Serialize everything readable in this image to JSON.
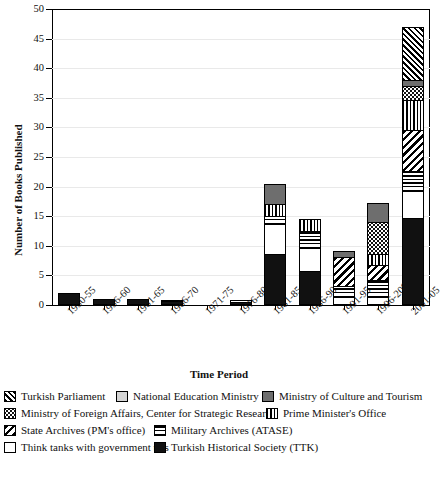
{
  "chart_data": {
    "type": "bar",
    "stacked": true,
    "title": "",
    "xlabel": "Time Period",
    "ylabel": "Number of Books Published",
    "ylim": [
      0,
      50
    ],
    "ytick_step": 5,
    "yticks": [
      0,
      5,
      10,
      15,
      20,
      25,
      30,
      35,
      40,
      45,
      50
    ],
    "grid": true,
    "legend_position": "below",
    "categories": [
      "1950-55",
      "1956-60",
      "1961-65",
      "1966-70",
      "1971-75",
      "1976-80",
      "1981-85",
      "1986-90",
      "1991-95",
      "1996-2000",
      "2001-05"
    ],
    "series": [
      {
        "name": "Turkish Historical Society (TTK)",
        "pattern": "solid-black",
        "values": [
          2.0,
          1.0,
          1.0,
          0.6,
          0.0,
          0.5,
          8.5,
          5.5,
          0.0,
          0.0,
          14.5
        ]
      },
      {
        "name": "Think tanks with government ties",
        "pattern": "white",
        "values": [
          0.0,
          0.0,
          0.0,
          0.3,
          0.0,
          0.3,
          5.0,
          4.0,
          1.0,
          1.0,
          4.5
        ]
      },
      {
        "name": "Military Archives (ATASE)",
        "pattern": "horizontal-stripes",
        "values": [
          0.0,
          0.0,
          0.0,
          0.0,
          0.0,
          0.0,
          1.5,
          3.0,
          2.0,
          3.0,
          3.5
        ]
      },
      {
        "name": "State Archives (PM's office)",
        "pattern": "diagonal-backslash",
        "values": [
          0.0,
          0.0,
          0.0,
          0.0,
          0.0,
          0.0,
          0.0,
          0.0,
          5.0,
          2.5,
          7.0
        ]
      },
      {
        "name": "Prime Minister's Office",
        "pattern": "vertical-stripes",
        "values": [
          0.0,
          0.0,
          0.0,
          0.0,
          0.0,
          0.0,
          2.0,
          2.0,
          0.0,
          2.0,
          5.0
        ]
      },
      {
        "name": "Ministry of Foreign Affairs, Center for Strategic Research",
        "pattern": "dotted",
        "values": [
          0.0,
          0.0,
          0.0,
          0.0,
          0.0,
          0.0,
          0.0,
          0.0,
          0.0,
          5.5,
          2.5
        ]
      },
      {
        "name": "Ministry of Culture and Tourism",
        "pattern": "dark-gray",
        "values": [
          0.0,
          0.0,
          0.0,
          0.0,
          0.0,
          0.0,
          3.5,
          0.0,
          1.2,
          3.3,
          1.0
        ]
      },
      {
        "name": "National Education Ministry",
        "pattern": "light-gray",
        "values": [
          0.0,
          0.0,
          0.0,
          0.0,
          0.0,
          0.0,
          0.0,
          0.0,
          0.0,
          0.0,
          0.0
        ]
      },
      {
        "name": "Turkish Parliament",
        "pattern": "diagonal-dense",
        "values": [
          0.0,
          0.0,
          0.0,
          0.0,
          0.0,
          0.0,
          0.0,
          0.0,
          0.0,
          0.0,
          9.0
        ]
      }
    ],
    "totals": [
      2.0,
      1.0,
      1.0,
      0.9,
      0.0,
      0.8,
      20.5,
      14.5,
      9.2,
      17.3,
      47.0
    ]
  },
  "legend": {
    "items": [
      {
        "label": "Turkish Parliament",
        "pattern": "diagonal-dense"
      },
      {
        "label": "National Education Ministry",
        "pattern": "light-gray"
      },
      {
        "label": "Ministry of Culture and Tourism",
        "pattern": "dark-gray"
      },
      {
        "label": "Ministry of Foreign Affairs, Center for Strategic Research",
        "pattern": "dotted"
      },
      {
        "label": "Prime Minister's Office",
        "pattern": "vertical-stripes"
      },
      {
        "label": "State Archives (PM's office)",
        "pattern": "diagonal-backslash"
      },
      {
        "label": "Military Archives (ATASE)",
        "pattern": "horizontal-stripes"
      },
      {
        "label": "Think tanks with government ties",
        "pattern": "white"
      },
      {
        "label": "Turkish Historical Society (TTK)",
        "pattern": "solid-black"
      }
    ]
  },
  "colors": {
    "axis": "#000000",
    "grid": "#e9e9e9",
    "background": "#ffffff",
    "solid_black": "#111111",
    "dark_gray": "#6e6e6e",
    "light_gray": "#d5d5d5"
  }
}
